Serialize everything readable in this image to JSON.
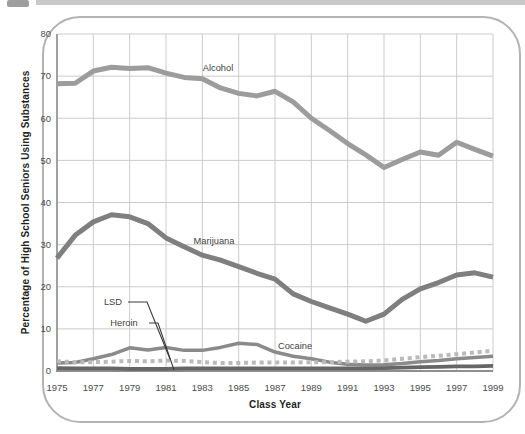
{
  "chart_data": {
    "type": "line",
    "title": "",
    "xlabel": "Class Year",
    "ylabel": "Percentage of High School Seniors Using Substances",
    "x": [
      1975,
      1976,
      1977,
      1978,
      1979,
      1980,
      1981,
      1982,
      1983,
      1984,
      1985,
      1986,
      1987,
      1988,
      1989,
      1990,
      1991,
      1992,
      1993,
      1994,
      1995,
      1996,
      1997,
      1998,
      1999
    ],
    "x_tick_years": [
      1975,
      1977,
      1979,
      1981,
      1983,
      1985,
      1987,
      1989,
      1991,
      1993,
      1995,
      1997,
      1999
    ],
    "x_tick_labels": [
      "1975",
      "1977",
      "1979",
      "1981",
      "1983",
      "1985",
      "1987",
      "1989",
      "1991",
      "1993",
      "1995",
      "1997",
      "1999"
    ],
    "y_ticks": [
      0,
      10,
      20,
      30,
      40,
      50,
      60,
      70,
      80
    ],
    "ylim": [
      0,
      80
    ],
    "xlim": [
      1975,
      1999
    ],
    "grid": true,
    "grid_color": "#cbcbcb",
    "axis_color": "#8f8f8f",
    "series": [
      {
        "name": "Alcohol",
        "color": "#9c9c9c",
        "style": "solid",
        "width": 5,
        "values": [
          68.2,
          68.3,
          71.2,
          72.1,
          71.8,
          72.0,
          70.7,
          69.7,
          69.4,
          67.2,
          65.9,
          65.3,
          66.4,
          63.9,
          60.0,
          57.1,
          54.0,
          51.3,
          48.3,
          50.2,
          52.0,
          51.2,
          54.3,
          52.6,
          51.0
        ]
      },
      {
        "name": "Marijuana",
        "color": "#7f7f7f",
        "style": "solid",
        "width": 5,
        "values": [
          26.8,
          32.2,
          35.4,
          37.1,
          36.6,
          35.0,
          31.6,
          29.5,
          27.5,
          26.3,
          24.8,
          23.2,
          21.8,
          18.3,
          16.5,
          15.0,
          13.5,
          11.8,
          13.5,
          17.0,
          19.5,
          21.0,
          22.8,
          23.3,
          22.3
        ]
      },
      {
        "name": "Cocaine",
        "color": "#8a8a8a",
        "style": "solid",
        "width": 3.5,
        "values": [
          1.9,
          2.0,
          2.9,
          3.9,
          5.5,
          5.0,
          5.6,
          4.9,
          4.9,
          5.6,
          6.6,
          6.3,
          4.5,
          3.5,
          2.9,
          2.1,
          1.6,
          1.4,
          1.5,
          1.8,
          2.2,
          2.5,
          2.9,
          3.2,
          3.5
        ]
      },
      {
        "name": "LSD",
        "color": "#bababa",
        "style": "dotted",
        "width": 4,
        "values": [
          2.3,
          2.1,
          2.1,
          2.2,
          2.4,
          2.3,
          2.5,
          2.4,
          2.1,
          1.9,
          1.9,
          2.0,
          2.0,
          2.0,
          2.1,
          2.1,
          2.2,
          2.3,
          2.5,
          2.9,
          3.3,
          3.6,
          4.0,
          4.4,
          4.8
        ]
      },
      {
        "name": "Heroin",
        "color": "#666666",
        "style": "solid",
        "width": 3.8,
        "values": [
          0.7,
          0.6,
          0.6,
          0.6,
          0.5,
          0.5,
          0.5,
          0.6,
          0.6,
          0.6,
          0.6,
          0.6,
          0.6,
          0.6,
          0.6,
          0.6,
          0.6,
          0.6,
          0.7,
          0.8,
          0.9,
          1.0,
          1.1,
          1.1,
          1.2
        ]
      }
    ],
    "series_labels": [
      {
        "text": "Alcohol",
        "cx": 218,
        "cy": 68
      },
      {
        "text": "Marijuana",
        "cx": 214,
        "cy": 241
      },
      {
        "text": "LSD",
        "cx": 113,
        "cy": 302
      },
      {
        "text": "Heroin",
        "cx": 124,
        "cy": 323
      },
      {
        "text": "Cocaine",
        "cx": 295,
        "cy": 346
      }
    ],
    "callouts": [
      {
        "for": "LSD",
        "points": [
          [
            128,
            302
          ],
          [
            147,
            302
          ],
          [
            170,
            359
          ]
        ]
      },
      {
        "for": "Heroin",
        "points": [
          [
            149,
            323
          ],
          [
            158,
            323
          ],
          [
            174,
            370
          ]
        ]
      }
    ],
    "callout_color": "#3a3a3a",
    "legend": "none"
  }
}
